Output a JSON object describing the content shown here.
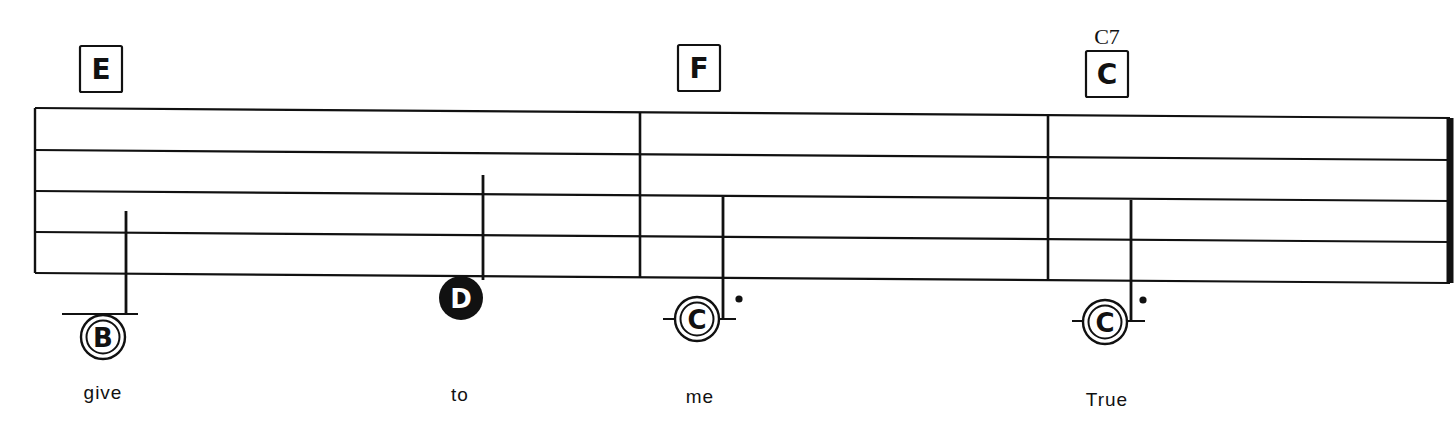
{
  "sheet": {
    "background": "#ffffff",
    "ink": "#111111",
    "staff": {
      "x_start": 35,
      "x_end": 1450,
      "lines_left_y": [
        108,
        150,
        191,
        232,
        273
      ],
      "lines_right_y": [
        118,
        160,
        201,
        242,
        283
      ]
    },
    "barlines": [
      {
        "x": 640,
        "kind": "single"
      },
      {
        "x": 1048,
        "kind": "single"
      },
      {
        "x": 1450,
        "kind": "end"
      }
    ],
    "chords": [
      {
        "letter": "E",
        "label": "",
        "x": 101,
        "y": 69
      },
      {
        "letter": "F",
        "label": "",
        "x": 699,
        "y": 68
      },
      {
        "letter": "C",
        "label": "C7",
        "x": 1107,
        "y": 74
      }
    ],
    "notes": [
      {
        "letter": "B",
        "filled": false,
        "double_ring": true,
        "x": 103,
        "y": 337,
        "stem_x": 126,
        "stem_top": 211,
        "stem_bottom": 314,
        "ledger_y": 314,
        "ledger_x1": 62,
        "ledger_x2": 138,
        "dotted": false
      },
      {
        "letter": "D",
        "filled": true,
        "double_ring": false,
        "x": 461,
        "y": 298,
        "stem_x": 483,
        "stem_top": 175,
        "stem_bottom": 280,
        "ledger_y": null,
        "dotted": false
      },
      {
        "letter": "C",
        "filled": false,
        "double_ring": true,
        "x": 697,
        "y": 319,
        "stem_x": 723,
        "stem_top": 197,
        "stem_bottom": 318,
        "ledger_y": 319,
        "ledger_x1": 663,
        "ledger_x2": 736,
        "dotted": true,
        "dot_x": 739,
        "dot_y": 299
      },
      {
        "letter": "C",
        "filled": false,
        "double_ring": true,
        "x": 1105,
        "y": 322,
        "stem_x": 1131,
        "stem_top": 200,
        "stem_bottom": 320,
        "ledger_y": 321,
        "ledger_x1": 1072,
        "ledger_x2": 1145,
        "dotted": true,
        "dot_x": 1143,
        "dot_y": 300
      }
    ],
    "lyrics": [
      {
        "text": "give",
        "x": 103,
        "y": 399
      },
      {
        "text": "to",
        "x": 460,
        "y": 401
      },
      {
        "text": "me",
        "x": 700,
        "y": 403
      },
      {
        "text": "True",
        "x": 1107,
        "y": 406
      }
    ]
  }
}
